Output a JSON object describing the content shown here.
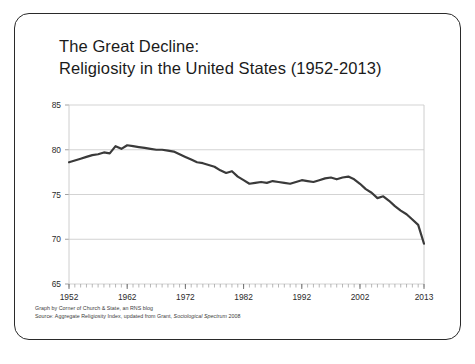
{
  "slide": {
    "title_lines": [
      "The Great Decline:",
      "Religiosity in the United States (1952-2013)"
    ],
    "footer_lines": [
      "Graph by Corner of Church & State, an RNS blog"
    ],
    "source_prefix": "Source: Aggregate Religiosity Index, updated from Grant, ",
    "source_italic": "Sociological Spectrum",
    "source_suffix": " 2008",
    "border_color": "#2a2a2a",
    "background": "#ffffff"
  },
  "chart_data": {
    "type": "line",
    "title": "The Great Decline: Religiosity in the United States (1952-2013)",
    "xlabel": "",
    "ylabel": "",
    "xlim": [
      1952,
      2013
    ],
    "ylim": [
      65,
      85
    ],
    "ytick_labels": [
      "85",
      "80",
      "75",
      "70",
      "65"
    ],
    "yticks": [
      85,
      80,
      75,
      70,
      65
    ],
    "xtick_labels": [
      "1952",
      "1962",
      "1972",
      "1982",
      "1992",
      "2002",
      "2013"
    ],
    "xticks": [
      1952,
      1962,
      1972,
      1982,
      1992,
      2002,
      2013
    ],
    "minor_xticks": true,
    "grid": true,
    "grid_color": "#c8c8c8",
    "line_color": "#3a3a3a",
    "line_width": 2.2,
    "legend": null,
    "series": [
      {
        "name": "Aggregate Religiosity Index",
        "x": [
          1952,
          1953,
          1954,
          1955,
          1956,
          1957,
          1958,
          1959,
          1960,
          1961,
          1962,
          1963,
          1964,
          1965,
          1966,
          1967,
          1968,
          1969,
          1970,
          1971,
          1972,
          1973,
          1974,
          1975,
          1976,
          1977,
          1978,
          1979,
          1980,
          1981,
          1982,
          1983,
          1984,
          1985,
          1986,
          1987,
          1988,
          1989,
          1990,
          1991,
          1992,
          1993,
          1994,
          1995,
          1996,
          1997,
          1998,
          1999,
          2000,
          2001,
          2002,
          2003,
          2004,
          2005,
          2006,
          2007,
          2008,
          2009,
          2010,
          2011,
          2012,
          2013
        ],
        "values": [
          78.6,
          78.8,
          79.0,
          79.2,
          79.4,
          79.5,
          79.7,
          79.6,
          80.4,
          80.1,
          80.5,
          80.4,
          80.3,
          80.2,
          80.1,
          80.0,
          80.0,
          79.9,
          79.8,
          79.5,
          79.2,
          78.9,
          78.6,
          78.5,
          78.3,
          78.1,
          77.7,
          77.4,
          77.6,
          77.0,
          76.6,
          76.2,
          76.3,
          76.4,
          76.3,
          76.5,
          76.4,
          76.3,
          76.2,
          76.4,
          76.6,
          76.5,
          76.4,
          76.6,
          76.8,
          76.9,
          76.7,
          76.9,
          77.0,
          76.7,
          76.2,
          75.6,
          75.2,
          74.6,
          74.8,
          74.3,
          73.7,
          73.2,
          72.8,
          72.2,
          71.6,
          69.5
        ]
      }
    ]
  }
}
